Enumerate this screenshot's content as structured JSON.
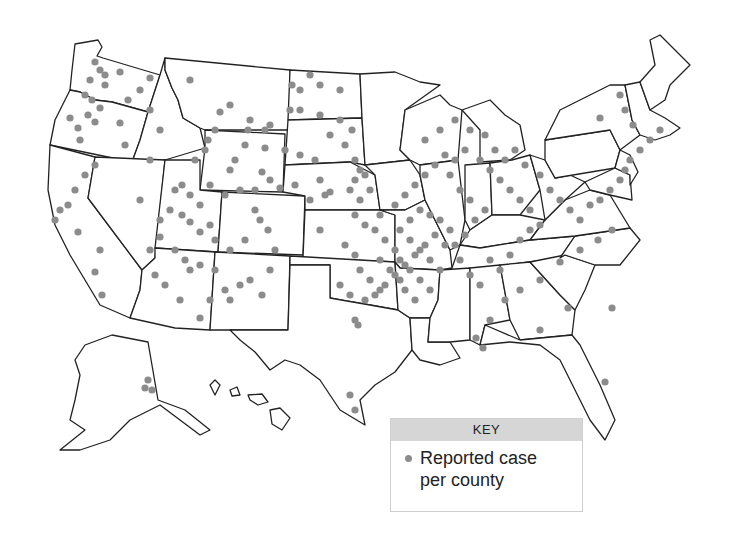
{
  "map": {
    "subject": "Reported cases per county, United States",
    "regions_shown": [
      "Contiguous United States",
      "Alaska",
      "Hawaii"
    ],
    "dot_color": "#8c8c8c",
    "outline_color": "#222222"
  },
  "legend": {
    "title": "KEY",
    "items": [
      {
        "symbol": "gray-dot",
        "label_line1": "Reported case",
        "label_line2": "per county"
      }
    ]
  },
  "chart_data": {
    "type": "scatter",
    "title": "",
    "legend": [
      "Reported case per county"
    ],
    "dots": [
      [
        95,
        62
      ],
      [
        100,
        70
      ],
      [
        90,
        80
      ],
      [
        105,
        85
      ],
      [
        85,
        95
      ],
      [
        92,
        100
      ],
      [
        100,
        108
      ],
      [
        88,
        115
      ],
      [
        95,
        122
      ],
      [
        78,
        128
      ],
      [
        70,
        118
      ],
      [
        80,
        140
      ],
      [
        105,
        75
      ],
      [
        120,
        72
      ],
      [
        150,
        78
      ],
      [
        140,
        90
      ],
      [
        128,
        100
      ],
      [
        150,
        110
      ],
      [
        120,
        123
      ],
      [
        160,
        130
      ],
      [
        85,
        175
      ],
      [
        95,
        165
      ],
      [
        125,
        145
      ],
      [
        150,
        160
      ],
      [
        140,
        200
      ],
      [
        60,
        210
      ],
      [
        55,
        220
      ],
      [
        68,
        205
      ],
      [
        78,
        232
      ],
      [
        75,
        190
      ],
      [
        102,
        295
      ],
      [
        95,
        272
      ],
      [
        190,
        80
      ],
      [
        230,
        105
      ],
      [
        220,
        112
      ],
      [
        215,
        130
      ],
      [
        248,
        130
      ],
      [
        265,
        130
      ],
      [
        270,
        125
      ],
      [
        208,
        140
      ],
      [
        205,
        150
      ],
      [
        245,
        145
      ],
      [
        250,
        120
      ],
      [
        265,
        148
      ],
      [
        235,
        160
      ],
      [
        230,
        170
      ],
      [
        195,
        160
      ],
      [
        182,
        185
      ],
      [
        175,
        190
      ],
      [
        190,
        195
      ],
      [
        200,
        205
      ],
      [
        210,
        185
      ],
      [
        225,
        195
      ],
      [
        240,
        190
      ],
      [
        255,
        190
      ],
      [
        262,
        172
      ],
      [
        270,
        180
      ],
      [
        280,
        188
      ],
      [
        295,
        185
      ],
      [
        285,
        150
      ],
      [
        300,
        155
      ],
      [
        315,
        160
      ],
      [
        320,
        180
      ],
      [
        330,
        192
      ],
      [
        310,
        200
      ],
      [
        320,
        230
      ],
      [
        325,
        195
      ],
      [
        292,
        85
      ],
      [
        300,
        90
      ],
      [
        310,
        75
      ],
      [
        320,
        85
      ],
      [
        340,
        90
      ],
      [
        290,
        110
      ],
      [
        300,
        110
      ],
      [
        320,
        115
      ],
      [
        340,
        120
      ],
      [
        352,
        130
      ],
      [
        330,
        135
      ],
      [
        345,
        145
      ],
      [
        355,
        160
      ],
      [
        360,
        170
      ],
      [
        365,
        175
      ],
      [
        355,
        180
      ],
      [
        350,
        190
      ],
      [
        360,
        200
      ],
      [
        370,
        190
      ],
      [
        160,
        220
      ],
      [
        170,
        210
      ],
      [
        182,
        215
      ],
      [
        190,
        222
      ],
      [
        200,
        232
      ],
      [
        210,
        225
      ],
      [
        215,
        240
      ],
      [
        160,
        237
      ],
      [
        150,
        250
      ],
      [
        175,
        250
      ],
      [
        185,
        260
      ],
      [
        200,
        265
      ],
      [
        215,
        270
      ],
      [
        230,
        250
      ],
      [
        245,
        240
      ],
      [
        255,
        210
      ],
      [
        260,
        220
      ],
      [
        268,
        230
      ],
      [
        275,
        250
      ],
      [
        270,
        270
      ],
      [
        250,
        280
      ],
      [
        240,
        285
      ],
      [
        225,
        290
      ],
      [
        262,
        295
      ],
      [
        190,
        270
      ],
      [
        155,
        275
      ],
      [
        165,
        285
      ],
      [
        180,
        300
      ],
      [
        200,
        318
      ],
      [
        210,
        300
      ],
      [
        230,
        300
      ],
      [
        100,
        250
      ],
      [
        355,
        215
      ],
      [
        365,
        225
      ],
      [
        375,
        230
      ],
      [
        385,
        240
      ],
      [
        395,
        250
      ],
      [
        400,
        260
      ],
      [
        410,
        270
      ],
      [
        420,
        280
      ],
      [
        430,
        290
      ],
      [
        380,
        260
      ],
      [
        390,
        270
      ],
      [
        400,
        280
      ],
      [
        405,
        290
      ],
      [
        415,
        300
      ],
      [
        360,
        270
      ],
      [
        370,
        280
      ],
      [
        380,
        290
      ],
      [
        345,
        245
      ],
      [
        355,
        255
      ],
      [
        410,
        240
      ],
      [
        420,
        250
      ],
      [
        430,
        260
      ],
      [
        440,
        270
      ],
      [
        445,
        245
      ],
      [
        450,
        230
      ],
      [
        440,
        220
      ],
      [
        430,
        215
      ],
      [
        420,
        210
      ],
      [
        410,
        220
      ],
      [
        400,
        230
      ],
      [
        435,
        235
      ],
      [
        425,
        245
      ],
      [
        415,
        255
      ],
      [
        405,
        265
      ],
      [
        395,
        275
      ],
      [
        385,
        285
      ],
      [
        375,
        295
      ],
      [
        365,
        300
      ],
      [
        350,
        295
      ],
      [
        340,
        285
      ],
      [
        460,
        260
      ],
      [
        470,
        275
      ],
      [
        480,
        285
      ],
      [
        490,
        260
      ],
      [
        500,
        270
      ],
      [
        510,
        255
      ],
      [
        520,
        240
      ],
      [
        530,
        230
      ],
      [
        540,
        225
      ],
      [
        455,
        245
      ],
      [
        465,
        235
      ],
      [
        475,
        220
      ],
      [
        485,
        210
      ],
      [
        470,
        200
      ],
      [
        460,
        190
      ],
      [
        450,
        175
      ],
      [
        455,
        160
      ],
      [
        465,
        150
      ],
      [
        480,
        160
      ],
      [
        490,
        170
      ],
      [
        500,
        180
      ],
      [
        510,
        190
      ],
      [
        520,
        200
      ],
      [
        530,
        210
      ],
      [
        380,
        215
      ],
      [
        395,
        205
      ],
      [
        405,
        195
      ],
      [
        415,
        185
      ],
      [
        425,
        175
      ],
      [
        435,
        165
      ],
      [
        445,
        155
      ],
      [
        425,
        140
      ],
      [
        440,
        130
      ],
      [
        455,
        120
      ],
      [
        470,
        130
      ],
      [
        485,
        135
      ],
      [
        495,
        150
      ],
      [
        505,
        160
      ],
      [
        515,
        150
      ],
      [
        525,
        165
      ],
      [
        540,
        175
      ],
      [
        550,
        190
      ],
      [
        560,
        200
      ],
      [
        570,
        210
      ],
      [
        580,
        220
      ],
      [
        590,
        205
      ],
      [
        600,
        200
      ],
      [
        610,
        190
      ],
      [
        620,
        180
      ],
      [
        625,
        170
      ],
      [
        630,
        160
      ],
      [
        640,
        150
      ],
      [
        650,
        140
      ],
      [
        660,
        130
      ],
      [
        600,
        118
      ],
      [
        620,
        95
      ],
      [
        625,
        110
      ],
      [
        633,
        125
      ],
      [
        612,
        230
      ],
      [
        598,
        240
      ],
      [
        580,
        250
      ],
      [
        560,
        262
      ],
      [
        540,
        280
      ],
      [
        520,
        290
      ],
      [
        505,
        300
      ],
      [
        490,
        320
      ],
      [
        476,
        338
      ],
      [
        483,
        348
      ],
      [
        355,
        320
      ],
      [
        358,
        325
      ],
      [
        350,
        395
      ],
      [
        355,
        410
      ],
      [
        605,
        382
      ],
      [
        612,
        308
      ],
      [
        540,
        330
      ],
      [
        568,
        308
      ],
      [
        148,
        380
      ],
      [
        145,
        388
      ],
      [
        152,
        390
      ]
    ]
  }
}
